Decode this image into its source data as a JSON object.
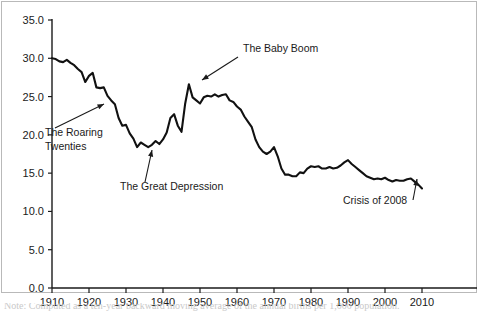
{
  "chart_data": {
    "type": "line",
    "title": "",
    "xlabel": "",
    "ylabel": "",
    "xlim": [
      1910,
      2010
    ],
    "ylim": [
      0,
      35
    ],
    "grid": false,
    "legend": "none",
    "yticks": [
      "0.0",
      "5.0",
      "10.0",
      "15.0",
      "20.0",
      "25.0",
      "30.0",
      "35.0"
    ],
    "ytick_values": [
      0,
      5,
      10,
      15,
      20,
      25,
      30,
      35
    ],
    "xticks": [
      "1910",
      "1920",
      "1930",
      "1940",
      "1950",
      "1960",
      "1970",
      "1980",
      "1990",
      "2000",
      "2010"
    ],
    "xtick_values": [
      1910,
      1920,
      1930,
      1940,
      1950,
      1960,
      1970,
      1980,
      1990,
      2000,
      2010
    ],
    "series": [
      {
        "name": "Birth rate per 1,000 population",
        "color": "#111111",
        "x": [
          1910,
          1911,
          1912,
          1913,
          1914,
          1915,
          1916,
          1917,
          1918,
          1919,
          1920,
          1921,
          1922,
          1923,
          1924,
          1925,
          1926,
          1927,
          1928,
          1929,
          1930,
          1931,
          1932,
          1933,
          1934,
          1935,
          1936,
          1937,
          1938,
          1939,
          1940,
          1941,
          1942,
          1943,
          1944,
          1945,
          1946,
          1947,
          1948,
          1949,
          1950,
          1951,
          1952,
          1953,
          1954,
          1955,
          1956,
          1957,
          1958,
          1959,
          1960,
          1961,
          1962,
          1963,
          1964,
          1965,
          1966,
          1967,
          1968,
          1969,
          1970,
          1971,
          1972,
          1973,
          1974,
          1975,
          1976,
          1977,
          1978,
          1979,
          1980,
          1981,
          1982,
          1983,
          1984,
          1985,
          1986,
          1987,
          1988,
          1989,
          1990,
          1991,
          1992,
          1993,
          1994,
          1995,
          1996,
          1997,
          1998,
          1999,
          2000,
          2001,
          2002,
          2003,
          2004,
          2005,
          2006,
          2007,
          2008,
          2009,
          2010
        ],
        "values": [
          30.0,
          29.9,
          29.6,
          29.5,
          29.8,
          29.4,
          29.1,
          28.6,
          28.2,
          26.9,
          27.7,
          28.1,
          26.2,
          26.1,
          26.2,
          25.1,
          24.5,
          24.0,
          22.2,
          21.2,
          21.3,
          20.2,
          19.5,
          18.4,
          19.0,
          18.7,
          18.4,
          18.7,
          19.2,
          18.8,
          19.4,
          20.3,
          22.2,
          22.7,
          21.2,
          20.4,
          24.1,
          26.6,
          24.9,
          24.5,
          24.1,
          24.9,
          25.1,
          25.0,
          25.3,
          25.0,
          25.2,
          25.3,
          24.5,
          24.3,
          23.7,
          23.3,
          22.4,
          21.7,
          21.0,
          19.4,
          18.4,
          17.8,
          17.5,
          17.8,
          18.4,
          17.2,
          15.6,
          14.8,
          14.8,
          14.6,
          14.6,
          15.1,
          15.0,
          15.6,
          15.9,
          15.8,
          15.9,
          15.6,
          15.6,
          15.8,
          15.6,
          15.7,
          16.0,
          16.4,
          16.7,
          16.2,
          15.8,
          15.4,
          15.0,
          14.6,
          14.4,
          14.2,
          14.3,
          14.2,
          14.4,
          14.1,
          13.9,
          14.1,
          14.0,
          14.0,
          14.2,
          14.3,
          13.9,
          13.5,
          13.0
        ]
      }
    ],
    "annotations": [
      {
        "id": "roaring-twenties",
        "label": "The Roaring",
        "label2": "Twenties",
        "target_x": 1924,
        "target_y": 26.2
      },
      {
        "id": "great-depression",
        "label": "The Great Depression",
        "target_x": 1934,
        "target_y": 19.0
      },
      {
        "id": "baby-boom",
        "label": "The Baby Boom",
        "target_x": 1947,
        "target_y": 26.6
      },
      {
        "id": "crisis-2008",
        "label": "Crisis of 2008",
        "target_x": 2008,
        "target_y": 13.9
      }
    ]
  },
  "caption": {
    "text": "Note: Computed as a ten-year backward moving average of the annual births per 1,000 population."
  }
}
